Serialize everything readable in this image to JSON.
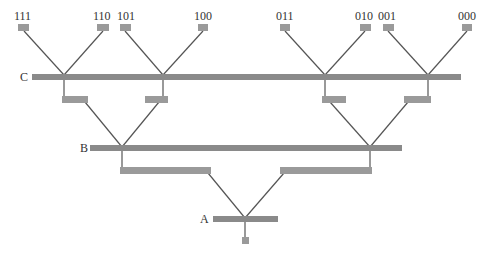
{
  "diagram": {
    "type": "binary-tree-bus-network",
    "colors": {
      "bar": "#8a8a8a",
      "box": "#9a9a9a",
      "line": "#555555",
      "text": "#333333"
    },
    "levels": [
      {
        "id": "A",
        "label": "A"
      },
      {
        "id": "B",
        "label": "B"
      },
      {
        "id": "C",
        "label": "C"
      }
    ],
    "leaves": [
      {
        "id": "111",
        "label": "111"
      },
      {
        "id": "110",
        "label": "110"
      },
      {
        "id": "101",
        "label": "101"
      },
      {
        "id": "100",
        "label": "100"
      },
      {
        "id": "011",
        "label": "011"
      },
      {
        "id": "010",
        "label": "010"
      },
      {
        "id": "001",
        "label": "001"
      },
      {
        "id": "000",
        "label": "000"
      }
    ]
  }
}
